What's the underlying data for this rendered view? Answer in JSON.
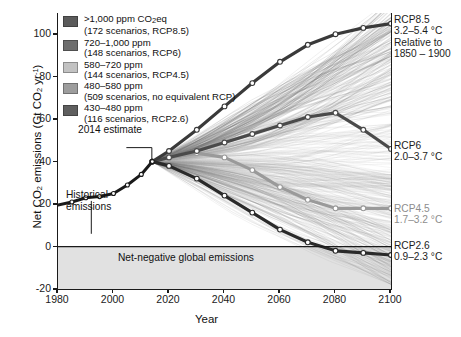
{
  "chart_data": {
    "type": "line",
    "title": "",
    "xlabel": "Year",
    "ylabel": "Net CO2 emissions (Gt CO2 yr-1)",
    "xlim": [
      1980,
      2100
    ],
    "ylim": [
      -20,
      110
    ],
    "xticks": [
      1980,
      2000,
      2020,
      2040,
      2060,
      2080,
      2100
    ],
    "yticks": [
      -20,
      0,
      20,
      40,
      60,
      80,
      100
    ],
    "grid": false,
    "legend_position": "top-left",
    "series": [
      {
        "name": "Historical emissions",
        "color": "#1a1a1a",
        "x": [
          1980,
          1985,
          1990,
          1995,
          2000,
          2005,
          2010,
          2014
        ],
        "values": [
          19.5,
          21.0,
          23.0,
          23.5,
          25.0,
          29.0,
          34.0,
          40.0
        ]
      },
      {
        "name": "RCP8.5",
        "color": "#3a3a3a",
        "x": [
          2014,
          2020,
          2030,
          2040,
          2050,
          2060,
          2070,
          2080,
          2090,
          2100
        ],
        "values": [
          40,
          45,
          55,
          66,
          77,
          87,
          95,
          100,
          103,
          105
        ]
      },
      {
        "name": "RCP6",
        "color": "#4a4a4a",
        "x": [
          2014,
          2020,
          2030,
          2040,
          2050,
          2060,
          2070,
          2080,
          2090,
          2100
        ],
        "values": [
          40,
          42,
          45,
          49,
          53,
          57,
          61,
          63,
          55,
          46
        ]
      },
      {
        "name": "RCP4.5",
        "color": "#9a9a9a",
        "x": [
          2014,
          2020,
          2030,
          2040,
          2050,
          2060,
          2070,
          2080,
          2090,
          2100
        ],
        "values": [
          40,
          42,
          44,
          42,
          36,
          28,
          22,
          18,
          18,
          18
        ]
      },
      {
        "name": "RCP2.6",
        "color": "#2a2a2a",
        "x": [
          2014,
          2020,
          2030,
          2040,
          2050,
          2060,
          2070,
          2080,
          2090,
          2100
        ],
        "values": [
          40,
          38,
          32,
          24,
          16,
          8,
          2,
          -2,
          -3,
          -4
        ]
      }
    ],
    "annotations": [
      {
        "name": "2014-estimate",
        "text": "2014 estimate",
        "x": 2014,
        "y": 40
      },
      {
        "name": "historical-emissions",
        "text": "Historical emissions",
        "x": 1992,
        "y": 20
      },
      {
        "name": "net-negative-band",
        "text": "Net-negative global emissions",
        "ylim": [
          -20,
          0
        ]
      }
    ]
  },
  "axes": {
    "ylabel_pre": "Net CO",
    "ylabel_sub1": "2",
    "ylabel_mid": " emissions (Gt CO",
    "ylabel_sub2": "2",
    "ylabel_unit": " yr",
    "ylabel_sup": "-1",
    "ylabel_post": ")",
    "xlabel": "Year",
    "yticks": [
      "100",
      "80",
      "60",
      "40",
      "20",
      "0",
      "-20"
    ],
    "xticks": [
      "1980",
      "2000",
      "2020",
      "2040",
      "2060",
      "2080",
      "2100"
    ]
  },
  "legend": {
    "items": [
      {
        "label": ">1,000 ppm CO",
        "label_sub": "2",
        "label_tail": "eq",
        "sub": "(172 scenarios, RCP8.5)",
        "color": "#5b5b5b"
      },
      {
        "label": "720–1,000 ppm",
        "label_sub": "",
        "label_tail": "",
        "sub": "(148 scenarios, RCP6)",
        "color": "#6e6e6e"
      },
      {
        "label": "580–720 ppm",
        "label_sub": "",
        "label_tail": "",
        "sub": "(144 scenarios, RCP4.5)",
        "color": "#c2c2c2"
      },
      {
        "label": "480–580 ppm",
        "label_sub": "",
        "label_tail": "",
        "sub": "(509 scenarios, no equivalent RCP)",
        "color": "#9d9d9d"
      },
      {
        "label": "430–480 ppm",
        "label_sub": "",
        "label_tail": "",
        "sub": "(116 scenarios, RCP2.6)",
        "color": "#5f5f5f"
      }
    ]
  },
  "annotations": {
    "estimate_2014": "2014 estimate",
    "historical_line1": "Historical",
    "historical_line2": "emissions",
    "net_negative": "Net-negative global emissions"
  },
  "scenario_labels": {
    "rcp85": {
      "name": "RCP8.5",
      "range": "3.2–5.4 °C",
      "relative1": "Relative to",
      "relative2": "1850 – 1900"
    },
    "rcp6": {
      "name": "RCP6",
      "range": "2.0–3.7 °C"
    },
    "rcp45": {
      "name": "RCP4.5",
      "range": "1.7–3.2 °C"
    },
    "rcp26": {
      "name": "RCP2.6",
      "range": "0.9–2.3 °C"
    }
  },
  "colors": {
    "axis": "#1a1a1a",
    "net_negative_band": "#dcdcdc",
    "rcp85": "#3a3a3a",
    "rcp6": "#4a4a4a",
    "rcp45": "#9a9a9a",
    "rcp26": "#2a2a2a"
  }
}
